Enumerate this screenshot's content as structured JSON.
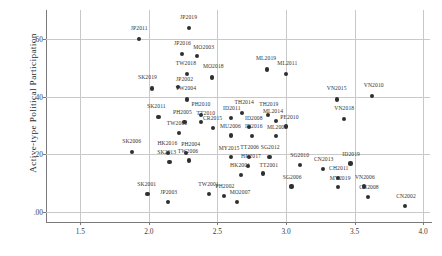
{
  "chart_data": {
    "type": "scatter",
    "title": "",
    "xlabel": "",
    "ylabel": "Active-type Political Participation",
    "xlim": [
      1.25,
      4.05
    ],
    "ylim": [
      -0.035,
      0.7
    ],
    "grid": true,
    "legend": "none",
    "xticks": [
      "1.5",
      "2.0",
      "2.5",
      "3.0",
      "3.5",
      "4.0"
    ],
    "xtick_values": [
      1.5,
      2.0,
      2.5,
      3.0,
      3.5,
      4.0
    ],
    "yticks": [
      ".00",
      ".20",
      ".40",
      ".60"
    ],
    "ytick_values": [
      0.0,
      0.2,
      0.4,
      0.6
    ],
    "points": [
      {
        "label": "JP2011",
        "x": 1.93,
        "y": 0.6,
        "lx": 1.93,
        "ly": 0.628
      },
      {
        "label": "JP2019",
        "x": 2.29,
        "y": 0.638,
        "lx": 2.29,
        "ly": 0.666
      },
      {
        "label": "JP2016",
        "x": 2.24,
        "y": 0.548,
        "lx": 2.245,
        "ly": 0.576
      },
      {
        "label": "MO2003",
        "x": 2.35,
        "y": 0.54,
        "lx": 2.4,
        "ly": 0.563
      },
      {
        "label": "TW2018",
        "x": 2.28,
        "y": 0.477,
        "lx": 2.27,
        "ly": 0.505
      },
      {
        "label": "MO2018",
        "x": 2.46,
        "y": 0.466,
        "lx": 2.47,
        "ly": 0.494
      },
      {
        "label": "SK2019",
        "x": 2.02,
        "y": 0.428,
        "lx": 1.99,
        "ly": 0.456
      },
      {
        "label": "JP2002",
        "x": 2.21,
        "y": 0.432,
        "lx": 2.26,
        "ly": 0.452
      },
      {
        "label": "ML2019",
        "x": 2.86,
        "y": 0.494,
        "lx": 2.855,
        "ly": 0.522
      },
      {
        "label": "ML2011",
        "x": 3.0,
        "y": 0.478,
        "lx": 3.01,
        "ly": 0.506
      },
      {
        "label": "TW2004",
        "x": 2.28,
        "y": 0.39,
        "lx": 2.27,
        "ly": 0.418
      },
      {
        "label": "VN2015",
        "x": 3.37,
        "y": 0.39,
        "lx": 3.37,
        "ly": 0.418
      },
      {
        "label": "VN2010",
        "x": 3.63,
        "y": 0.403,
        "lx": 3.64,
        "ly": 0.431
      },
      {
        "label": "SK2011",
        "x": 2.07,
        "y": 0.33,
        "lx": 2.055,
        "ly": 0.358
      },
      {
        "label": "PH2010",
        "x": 2.38,
        "y": 0.337,
        "lx": 2.38,
        "ly": 0.365
      },
      {
        "label": "PH2005",
        "x": 2.26,
        "y": 0.312,
        "lx": 2.245,
        "ly": 0.336
      },
      {
        "label": "TT2010",
        "x": 2.38,
        "y": 0.312,
        "lx": 2.415,
        "ly": 0.334
      },
      {
        "label": "ID2011",
        "x": 2.6,
        "y": 0.325,
        "lx": 2.605,
        "ly": 0.35
      },
      {
        "label": "TH2014",
        "x": 2.68,
        "y": 0.343,
        "lx": 2.695,
        "ly": 0.369
      },
      {
        "label": "TH2019",
        "x": 2.87,
        "y": 0.337,
        "lx": 2.875,
        "ly": 0.365
      },
      {
        "label": "ML2014",
        "x": 2.93,
        "y": 0.315,
        "lx": 2.905,
        "ly": 0.34
      },
      {
        "label": "VN2018",
        "x": 3.42,
        "y": 0.322,
        "lx": 3.425,
        "ly": 0.35
      },
      {
        "label": "CR2015",
        "x": 2.47,
        "y": 0.291,
        "lx": 2.465,
        "ly": 0.314
      },
      {
        "label": "ID2008",
        "x": 2.73,
        "y": 0.295,
        "lx": 2.765,
        "ly": 0.316
      },
      {
        "label": "PE2010",
        "x": 3.0,
        "y": 0.296,
        "lx": 3.025,
        "ly": 0.317
      },
      {
        "label": "TW2000",
        "x": 2.22,
        "y": 0.273,
        "lx": 2.205,
        "ly": 0.297
      },
      {
        "label": "MU2006",
        "x": 2.6,
        "y": 0.265,
        "lx": 2.595,
        "ly": 0.288
      },
      {
        "label": "ID2016",
        "x": 2.75,
        "y": 0.263,
        "lx": 2.765,
        "ly": 0.286
      },
      {
        "label": "ML2007",
        "x": 2.93,
        "y": 0.262,
        "lx": 2.935,
        "ly": 0.284
      },
      {
        "label": "SK2006",
        "x": 1.88,
        "y": 0.207,
        "lx": 1.875,
        "ly": 0.235
      },
      {
        "label": "HK2016",
        "x": 2.14,
        "y": 0.203,
        "lx": 2.135,
        "ly": 0.228
      },
      {
        "label": "PH2004",
        "x": 2.27,
        "y": 0.203,
        "lx": 2.305,
        "ly": 0.224
      },
      {
        "label": "TW2006",
        "x": 2.29,
        "y": 0.178,
        "lx": 2.285,
        "ly": 0.202
      },
      {
        "label": "SK2013",
        "x": 2.15,
        "y": 0.172,
        "lx": 2.13,
        "ly": 0.196
      },
      {
        "label": "MY2015",
        "x": 2.6,
        "y": 0.19,
        "lx": 2.585,
        "ly": 0.212
      },
      {
        "label": "TT2006",
        "x": 2.73,
        "y": 0.19,
        "lx": 2.735,
        "ly": 0.213
      },
      {
        "label": "SG2012",
        "x": 2.88,
        "y": 0.19,
        "lx": 2.885,
        "ly": 0.213
      },
      {
        "label": "HK2017",
        "x": 2.72,
        "y": 0.16,
        "lx": 2.745,
        "ly": 0.182
      },
      {
        "label": "HK2001",
        "x": 2.67,
        "y": 0.128,
        "lx": 2.665,
        "ly": 0.152
      },
      {
        "label": "TT2001",
        "x": 2.83,
        "y": 0.133,
        "lx": 2.875,
        "ly": 0.153
      },
      {
        "label": "SG2010",
        "x": 3.1,
        "y": 0.162,
        "lx": 3.1,
        "ly": 0.186
      },
      {
        "label": "CN2013",
        "x": 3.27,
        "y": 0.149,
        "lx": 3.275,
        "ly": 0.172
      },
      {
        "label": "ID2019",
        "x": 3.47,
        "y": 0.168,
        "lx": 3.475,
        "ly": 0.191
      },
      {
        "label": "CH2011",
        "x": 3.38,
        "y": 0.118,
        "lx": 3.385,
        "ly": 0.142
      },
      {
        "label": "SG2006",
        "x": 3.04,
        "y": 0.088,
        "lx": 3.045,
        "ly": 0.112
      },
      {
        "label": "MY2019",
        "x": 3.38,
        "y": 0.086,
        "lx": 3.395,
        "ly": 0.108
      },
      {
        "label": "VN2006",
        "x": 3.57,
        "y": 0.088,
        "lx": 3.575,
        "ly": 0.111
      },
      {
        "label": "CN2008",
        "x": 3.6,
        "y": 0.053,
        "lx": 3.605,
        "ly": 0.076
      },
      {
        "label": "CN2002",
        "x": 3.87,
        "y": 0.02,
        "lx": 3.875,
        "ly": 0.045
      },
      {
        "label": "SK2001",
        "x": 1.99,
        "y": 0.063,
        "lx": 1.985,
        "ly": 0.087
      },
      {
        "label": "JP2003",
        "x": 2.14,
        "y": 0.033,
        "lx": 2.145,
        "ly": 0.058
      },
      {
        "label": "TW2001",
        "x": 2.44,
        "y": 0.063,
        "lx": 2.435,
        "ly": 0.087
      },
      {
        "label": "PH2002",
        "x": 2.55,
        "y": 0.056,
        "lx": 2.555,
        "ly": 0.08
      },
      {
        "label": "MO2007",
        "x": 2.64,
        "y": 0.035,
        "lx": 2.665,
        "ly": 0.057
      }
    ]
  }
}
